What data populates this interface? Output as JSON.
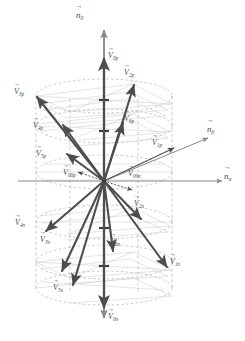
{
  "figure": {
    "type": "vector-space-diagram",
    "colors": {
      "vector": "#4d4d4d",
      "axis": "#808080",
      "cylinder": "#b0b0b0",
      "grid": "#c8c8c8",
      "label": "#4d4d4d",
      "background": "#ffffff"
    }
  },
  "axes": [
    {
      "id": "n0",
      "label_base": "n",
      "label_sub": "0",
      "direction": "vertical-up",
      "name": "n-zero-axis"
    },
    {
      "id": "nalpha",
      "label_base": "n",
      "label_sub": "α",
      "direction": "horizontal-right",
      "name": "n-alpha-axis"
    },
    {
      "id": "nbeta",
      "label_base": "n",
      "label_sub": "β",
      "direction": "oblique-up-right",
      "name": "n-beta-axis"
    }
  ],
  "vectors": {
    "positive": [
      {
        "id": "V1p",
        "base": "V",
        "sub": "1p",
        "angle_deg": 18,
        "tip": [
          175,
          148
        ]
      },
      {
        "id": "V2p",
        "base": "V",
        "sub": "2p",
        "angle_deg": 62,
        "tip": [
          133,
          84
        ]
      },
      {
        "id": "V3p",
        "base": "V",
        "sub": "3p",
        "angle_deg": 140,
        "tip": [
          36,
          96
        ]
      },
      {
        "id": "V4p",
        "base": "V",
        "sub": "4p",
        "angle_deg": 110,
        "tip": [
          62,
          124
        ]
      },
      {
        "id": "V5p",
        "base": "V",
        "sub": "5p",
        "angle_deg": 125,
        "tip": [
          66,
          153
        ]
      },
      {
        "id": "V6p",
        "base": "V",
        "sub": "6p",
        "angle_deg": 72,
        "tip": [
          122,
          122
        ]
      }
    ],
    "negative": [
      {
        "id": "V1n",
        "base": "V",
        "sub": "1n",
        "angle_deg": 198,
        "tip": [
          168,
          268
        ]
      },
      {
        "id": "V2n",
        "base": "V",
        "sub": "2n",
        "angle_deg": 242,
        "tip": [
          140,
          218
        ]
      },
      {
        "id": "V3n",
        "base": "V",
        "sub": "3n",
        "angle_deg": 320,
        "tip": [
          72,
          286
        ]
      },
      {
        "id": "V4n",
        "base": "V",
        "sub": "4n",
        "angle_deg": 290,
        "tip": [
          45,
          232
        ]
      },
      {
        "id": "V5n",
        "base": "V",
        "sub": "5n",
        "angle_deg": 305,
        "tip": [
          60,
          272
        ]
      },
      {
        "id": "V6n",
        "base": "V",
        "sub": "6n",
        "angle_deg": 252,
        "tip": [
          112,
          252
        ]
      }
    ],
    "zero": [
      {
        "id": "V00p",
        "base": "V",
        "sub": "00p",
        "name": "zero-vector-positive"
      },
      {
        "id": "V00n",
        "base": "V",
        "sub": "00n",
        "name": "zero-vector-negative"
      }
    ],
    "axial": [
      {
        "id": "V0p",
        "base": "V",
        "sub": "0p",
        "direction": "up",
        "name": "axial-vector-positive"
      },
      {
        "id": "V0n",
        "base": "V",
        "sub": "0n",
        "direction": "down",
        "name": "axial-vector-negative"
      }
    ]
  },
  "cylinder": {
    "center_x": 104,
    "top_y": 96,
    "bottom_y": 288,
    "radius_x": 68,
    "radius_y": 17,
    "ellipse_levels": [
      96,
      126,
      172,
      222,
      262,
      288
    ],
    "style": "dashed"
  }
}
